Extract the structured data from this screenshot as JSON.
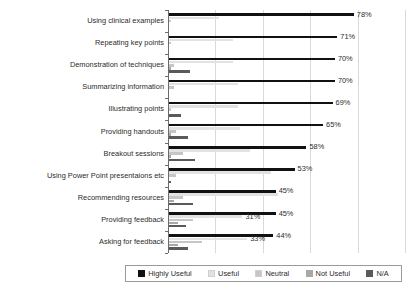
{
  "chart_data": {
    "type": "bar",
    "orientation": "horizontal",
    "title": "",
    "xlabel": "",
    "ylabel": "",
    "xlim": [
      0,
      100
    ],
    "grid": true,
    "legend_position": "bottom",
    "categories": [
      "Using clinical examples",
      "Repeating key points",
      "Demonstration of techniques",
      "Summarizing information",
      "Illustrating points",
      "Providing handouts",
      "Breakout sessions",
      "Using Power Point presentaions etc",
      "Recommending resources",
      "Providing feedback",
      "Asking for feedback"
    ],
    "series": [
      {
        "name": "Highly Useful",
        "color": "#111111",
        "values": [
          78,
          71,
          70,
          70,
          69,
          65,
          58,
          53,
          45,
          45,
          44
        ]
      },
      {
        "name": "Useful",
        "color": "#e2e2e2",
        "values": [
          21,
          27,
          27,
          29,
          29,
          30,
          34,
          43,
          46,
          31,
          33
        ]
      },
      {
        "name": "Neutral",
        "color": "#c6c6c6",
        "values": [
          1,
          1,
          2,
          2,
          1,
          3,
          6,
          3,
          6,
          10,
          14
        ]
      },
      {
        "name": "Not Useful",
        "color": "#a8a8a8",
        "values": [
          0,
          0,
          1,
          0,
          0,
          1,
          1,
          0,
          2,
          4,
          4
        ]
      },
      {
        "name": "N/A",
        "color": "#5a5a5a",
        "values": [
          0,
          0,
          9,
          0,
          5,
          8,
          11,
          1,
          10,
          7,
          8
        ]
      }
    ],
    "data_labels": [
      {
        "category": "Using clinical examples",
        "series": "Highly Useful",
        "text": "78%"
      },
      {
        "category": "Repeating key points",
        "series": "Highly Useful",
        "text": "71%"
      },
      {
        "category": "Demonstration of techniques",
        "series": "Highly Useful",
        "text": "70%"
      },
      {
        "category": "Summarizing information",
        "series": "Highly Useful",
        "text": "70%"
      },
      {
        "category": "Illustrating points",
        "series": "Highly Useful",
        "text": "69%"
      },
      {
        "category": "Providing handouts",
        "series": "Highly Useful",
        "text": "65%"
      },
      {
        "category": "Breakout sessions",
        "series": "Highly Useful",
        "text": "58%"
      },
      {
        "category": "Using Power Point presentaions etc",
        "series": "Highly Useful",
        "text": "53%"
      },
      {
        "category": "Recommending resources",
        "series": "Highly Useful",
        "text": "45%"
      },
      {
        "category": "Providing feedback",
        "series": "Highly Useful",
        "text": "45%"
      },
      {
        "category": "Providing feedback",
        "series": "Useful",
        "text": "31%"
      },
      {
        "category": "Asking for feedback",
        "series": "Highly Useful",
        "text": "44%"
      },
      {
        "category": "Asking for feedback",
        "series": "Useful",
        "text": "33%"
      }
    ]
  },
  "legend": {
    "items": [
      {
        "label": "Highly Useful",
        "color": "#111111"
      },
      {
        "label": "Useful",
        "color": "#e2e2e2"
      },
      {
        "label": "Neutral",
        "color": "#c6c6c6"
      },
      {
        "label": "Not Useful",
        "color": "#a8a8a8"
      },
      {
        "label": "N/A",
        "color": "#5a5a5a"
      }
    ]
  }
}
